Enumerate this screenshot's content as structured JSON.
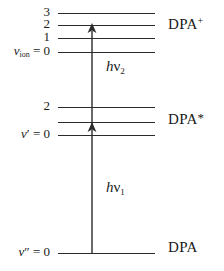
{
  "figure": {
    "type": "energy-level-diagram",
    "background_color": "#ffffff",
    "line_color": "#2b2b2b"
  },
  "states": [
    {
      "id": "ion",
      "name": "DPA+",
      "label_html": "DPA",
      "superscript": "+",
      "name_x": 168,
      "name_y": 23,
      "levels": [
        {
          "quantum_number": "3",
          "label": "3",
          "y": 13,
          "x": 58,
          "width": 97,
          "label_x": 30,
          "label_y": 7
        },
        {
          "quantum_number": "2",
          "label": "2",
          "y": 25,
          "x": 58,
          "width": 97,
          "label_x": 30,
          "label_y": 19
        },
        {
          "quantum_number": "1",
          "label": "1",
          "y": 38,
          "x": 58,
          "width": 97,
          "label_x": 30,
          "label_y": 32
        },
        {
          "quantum_number": "0",
          "label": "0",
          "y": 52,
          "x": 58,
          "width": 97,
          "label_x": 30,
          "label_y": 46
        }
      ],
      "axis_label": "v_ion = 0",
      "axis_label_x": 2,
      "axis_label_y": 46
    },
    {
      "id": "excited",
      "name": "DPA*",
      "label_html": "DPA",
      "superscript": "*",
      "name_x": 168,
      "name_y": 118,
      "levels": [
        {
          "quantum_number": "2",
          "label": "2",
          "y": 107,
          "x": 58,
          "width": 97,
          "label_x": 30,
          "label_y": 101
        },
        {
          "quantum_number": "1",
          "label": "",
          "y": 122,
          "x": 58,
          "width": 97,
          "label_x": 30,
          "label_y": 116
        },
        {
          "quantum_number": "0",
          "label": "0",
          "y": 135,
          "x": 58,
          "width": 97,
          "label_x": 30,
          "label_y": 129
        }
      ],
      "axis_label": "v' = 0",
      "axis_label_x": 13,
      "axis_label_y": 129
    },
    {
      "id": "ground",
      "name": "DPA",
      "label_html": "DPA",
      "superscript": "",
      "name_x": 168,
      "name_y": 247,
      "levels": [
        {
          "quantum_number": "0",
          "label": "0",
          "y": 253,
          "x": 58,
          "width": 97,
          "label_x": 30,
          "label_y": 247
        }
      ],
      "axis_label": "v'' = 0",
      "axis_label_x": 9,
      "axis_label_y": 247
    }
  ],
  "transitions": [
    {
      "id": "hv1",
      "photon": "hv1",
      "label_h": "h",
      "label_nu": "ν",
      "label_sub": "1",
      "x": 92,
      "y_start": 253,
      "y_end": 124,
      "label_x": 108,
      "label_y": 187,
      "direction": "up"
    },
    {
      "id": "hv2",
      "photon": "hv2",
      "label_h": "h",
      "label_nu": "ν",
      "label_sub": "2",
      "x": 92,
      "y_start": 124,
      "y_end": 25,
      "label_x": 108,
      "label_y": 66,
      "direction": "up"
    }
  ],
  "axis_labels": {
    "ion_var": "v",
    "ion_sub": "ion",
    "ion_eq": " = 0",
    "excited_var": "v",
    "excited_prime": "′",
    "excited_eq": " = 0",
    "ground_var": "v",
    "ground_prime": "″",
    "ground_eq": " = 0"
  },
  "state_labels": {
    "ion_base": "DPA",
    "ion_sup": "+",
    "excited_base": "DPA",
    "excited_sup": "*",
    "ground_base": "DPA"
  },
  "numbers": {
    "ion_3": "3",
    "ion_2": "2",
    "ion_1": "1",
    "excited_2": "2"
  }
}
